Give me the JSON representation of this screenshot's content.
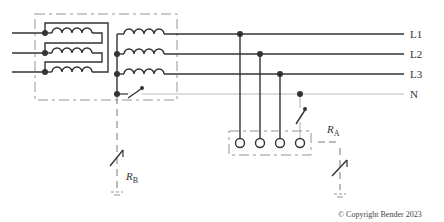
{
  "diagram": {
    "type": "TN-S / TT earthing system schematic",
    "lines": [
      {
        "id": "L1",
        "label": "L1",
        "y": 34
      },
      {
        "id": "L2",
        "label": "L2",
        "y": 54
      },
      {
        "id": "L3",
        "label": "L3",
        "y": 74
      },
      {
        "id": "N",
        "label": "N",
        "y": 94
      }
    ],
    "resistors": {
      "rb": {
        "label": "R",
        "sub": "B"
      },
      "ra": {
        "label": "R",
        "sub": "A"
      }
    },
    "copyright": "© Copyright Bender 2023",
    "colors": {
      "line": "#333333",
      "neutral": "#bbbbbb",
      "dashed": "#888888"
    }
  }
}
